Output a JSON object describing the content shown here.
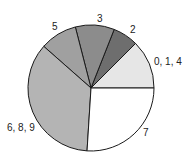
{
  "chart_data": {
    "type": "pie",
    "title": "",
    "start_angle_deg": 0,
    "direction": "counterclockwise",
    "categories": [
      "0, 1, 4",
      "2",
      "3",
      "5",
      "6, 8, 9",
      "7"
    ],
    "values": [
      12.5,
      6.5,
      10,
      9.5,
      35.5,
      26
    ],
    "colors": [
      "#e6e6e6",
      "#6e6e6e",
      "#8c8c8c",
      "#a0a0a0",
      "#b4b4b4",
      "#ffffff"
    ],
    "legend": "none (labels placed outside slices)"
  },
  "layout": {
    "cx": 91,
    "cy": 88,
    "r": 63,
    "labels": [
      {
        "text": "0, 1, 4",
        "x": 154,
        "y": 65
      },
      {
        "text": "2",
        "x": 130,
        "y": 33
      },
      {
        "text": "3",
        "x": 97,
        "y": 22
      },
      {
        "text": "5",
        "x": 52,
        "y": 30
      },
      {
        "text": "6, 8, 9",
        "x": 7,
        "y": 131
      },
      {
        "text": "7",
        "x": 143,
        "y": 136
      }
    ]
  }
}
